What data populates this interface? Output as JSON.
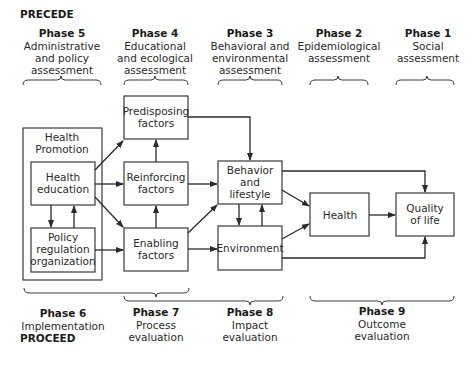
{
  "headers": {
    "precede": "PRECEDE",
    "proceed": "PROCEED"
  },
  "top_phases": [
    {
      "title": "Phase 5",
      "lines": [
        "Administrative",
        "and policy",
        "assessment"
      ]
    },
    {
      "title": "Phase 4",
      "lines": [
        "Educational",
        "and ecological",
        "assessment"
      ]
    },
    {
      "title": "Phase 3",
      "lines": [
        "Behavioral and",
        "environmental",
        "assessment"
      ]
    },
    {
      "title": "Phase 2",
      "lines": [
        "Epidemiological",
        "assessment"
      ]
    },
    {
      "title": "Phase 1",
      "lines": [
        "Social",
        "assessment"
      ]
    }
  ],
  "bottom_phases": [
    {
      "title": "Phase 6",
      "lines": [
        "Implementation"
      ]
    },
    {
      "title": "Phase 7",
      "lines": [
        "Process",
        "evaluation"
      ]
    },
    {
      "title": "Phase 8",
      "lines": [
        "Impact",
        "evaluation"
      ]
    },
    {
      "title": "Phase 9",
      "lines": [
        "Outcome",
        "evaluation"
      ]
    }
  ],
  "nodes": {
    "health_promotion": [
      "Health",
      "Promotion"
    ],
    "health_education": [
      "Health",
      "education"
    ],
    "policy": [
      "Policy",
      "regulation",
      "organization"
    ],
    "predisposing": [
      "Predisposing",
      "factors"
    ],
    "reinforcing": [
      "Reinforcing",
      "factors"
    ],
    "enabling": [
      "Enabling",
      "factors"
    ],
    "behavior": [
      "Behavior",
      "and",
      "lifestyle"
    ],
    "environment": [
      "Environment"
    ],
    "health": [
      "Health"
    ],
    "quality": [
      "Quality",
      "of life"
    ]
  },
  "colors": {
    "line": "#2a2a2a",
    "box_stroke": "#3a3a3a",
    "background": "#ffffff"
  }
}
